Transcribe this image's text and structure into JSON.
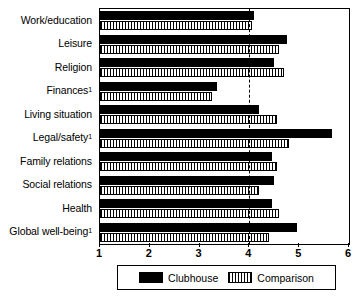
{
  "chart_data": {
    "type": "bar",
    "orientation": "horizontal",
    "title": "",
    "xlabel": "",
    "ylabel": "",
    "xlim": [
      1,
      6
    ],
    "xticks": [
      1,
      2,
      3,
      4,
      5,
      6
    ],
    "xtick_labels": [
      "1",
      "2",
      "3",
      "4",
      "5",
      "6"
    ],
    "grid": false,
    "legend_position": "bottom",
    "reference_line": 4,
    "categories": [
      "Work/education",
      "Leisure",
      "Religion",
      "Finances",
      "Living situation",
      "Legal/safety",
      "Family relations",
      "Social relations",
      "Health",
      "Global well-being"
    ],
    "category_footnotes": [
      "",
      "",
      "",
      "1",
      "",
      "1",
      "",
      "",
      "",
      "1"
    ],
    "series": [
      {
        "name": "Clubhouse",
        "color": "#000000",
        "pattern": "solid",
        "values": [
          4.1,
          4.75,
          4.5,
          3.35,
          4.2,
          5.65,
          4.45,
          4.5,
          4.45,
          4.95
        ]
      },
      {
        "name": "Comparison",
        "color": "#ffffff",
        "pattern": "vertical-hatch",
        "values": [
          4.05,
          4.6,
          4.7,
          3.25,
          4.55,
          4.8,
          4.55,
          4.2,
          4.6,
          4.4
        ]
      }
    ]
  },
  "legend": {
    "entries": [
      {
        "label": "Clubhouse",
        "swatch": "solid-black-swatch"
      },
      {
        "label": "Comparison",
        "swatch": "hatched-swatch"
      }
    ]
  }
}
